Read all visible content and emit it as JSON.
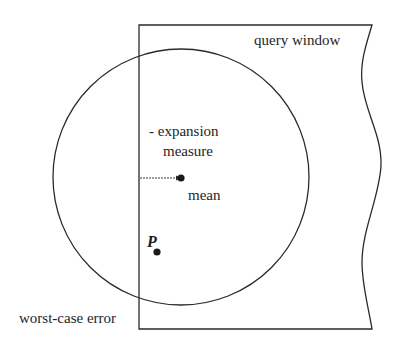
{
  "diagram": {
    "title": "",
    "labels": {
      "query_window": "query window",
      "expansion_line1": "- expansion",
      "expansion_line2": "measure",
      "mean": "mean",
      "point": "P",
      "worst_case_error": "worst-case error"
    },
    "shapes": {
      "query_window": {
        "left": 139,
        "top": 25,
        "bottom": 329,
        "right_edge": "wavy"
      },
      "circle": {
        "cx": 181,
        "cy": 177,
        "r": 128
      },
      "mean_point": {
        "x": 181,
        "y": 178
      },
      "p_point": {
        "x": 157,
        "y": 252
      },
      "arrow": {
        "x1": 140,
        "y1": 178,
        "x2": 178,
        "y2": 178
      }
    },
    "colors": {
      "stroke": "#2a2a2a",
      "text": "#1e1e1e",
      "background": "#ffffff"
    }
  }
}
